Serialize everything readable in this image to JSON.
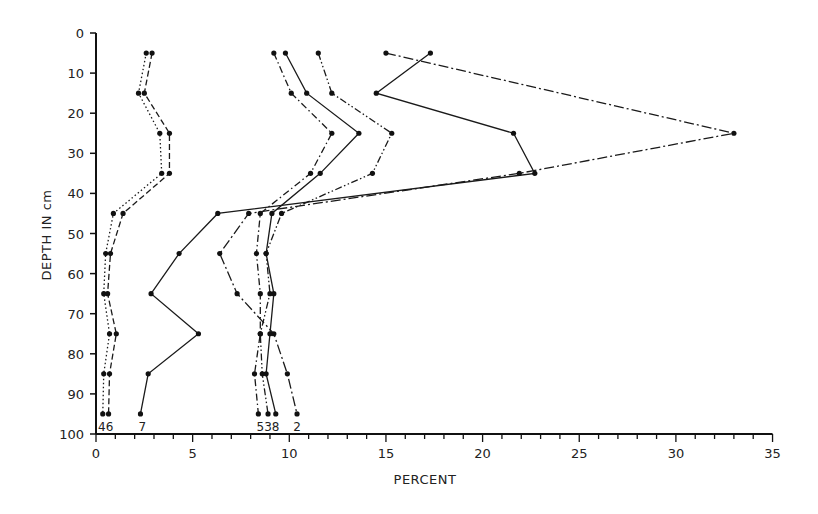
{
  "chart_data": {
    "type": "line",
    "title": "",
    "xlabel": "PERCENT",
    "ylabel": "DEPTH IN cm",
    "xlim": [
      0,
      35
    ],
    "ylim": [
      100,
      0
    ],
    "y_inverted": true,
    "x_ticks": [
      0,
      5,
      10,
      15,
      20,
      25,
      30,
      35
    ],
    "x_minor_step": 1,
    "y_ticks": [
      0,
      10,
      20,
      30,
      40,
      50,
      60,
      70,
      80,
      90,
      100
    ],
    "grid": false,
    "legend": "inline labels at bottom of each profile",
    "depths": [
      5,
      15,
      25,
      35,
      45,
      55,
      65,
      75,
      85,
      95
    ],
    "series": [
      {
        "name": "4",
        "style": "dotted",
        "values": [
          2.6,
          2.2,
          3.3,
          3.4,
          0.9,
          0.5,
          0.4,
          0.7,
          0.4,
          0.35
        ]
      },
      {
        "name": "6",
        "style": "dashed",
        "values": [
          2.9,
          2.5,
          3.8,
          3.8,
          1.4,
          0.75,
          0.6,
          1.05,
          0.7,
          0.65
        ]
      },
      {
        "name": "7",
        "style": "solid",
        "values": [
          17.3,
          14.5,
          21.6,
          22.7,
          6.3,
          4.3,
          2.85,
          5.3,
          2.7,
          2.3
        ]
      },
      {
        "name": "5",
        "style": "dash-dot",
        "values": [
          9.2,
          10.1,
          12.2,
          11.1,
          8.5,
          8.3,
          8.5,
          8.5,
          8.2,
          8.4
        ]
      },
      {
        "name": "3",
        "style": "dash-dot-dot",
        "values": [
          11.5,
          12.2,
          15.3,
          14.3,
          9.6,
          8.8,
          9.0,
          8.5,
          8.6,
          8.9
        ]
      },
      {
        "name": "8",
        "style": "solid",
        "values": [
          9.8,
          10.9,
          13.6,
          11.6,
          9.1,
          8.8,
          9.2,
          9.0,
          8.8,
          9.3
        ]
      },
      {
        "name": "2",
        "style": "long-dash-dot",
        "values": [
          15.0,
          null,
          33.0,
          21.9,
          7.9,
          6.4,
          7.3,
          9.2,
          9.9,
          10.4
        ]
      }
    ],
    "bottom_labels": [
      {
        "text": "46",
        "x": 0.5
      },
      {
        "text": "7",
        "x": 2.4
      },
      {
        "text": "538",
        "x": 8.9
      },
      {
        "text": "2",
        "x": 10.4
      }
    ]
  },
  "labels": {
    "xlabel": "PERCENT",
    "ylabel": "DEPTH IN cm"
  }
}
